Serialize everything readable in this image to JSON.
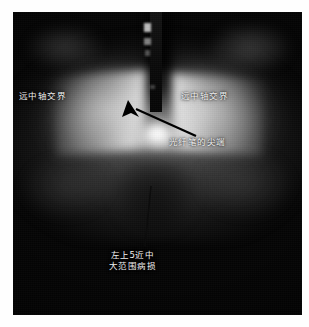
{
  "figure": {
    "type": "clinical-photograph",
    "modality": "fiber-optic transillumination (FOTI)",
    "frame_background": "#ffffff",
    "photo_background": "#050505"
  },
  "annotations": {
    "left_label": "远中轴交界",
    "right_label": "远中轴交界",
    "tip_label": "光纤笔的尖端",
    "lesion_label_line1": "左上5近中",
    "lesion_label_line2": "大范围病损"
  },
  "markers": {
    "arrow": {
      "name": "arrow-to-fiber-tip",
      "color": "#000000",
      "from_x": 196,
      "from_y": 136,
      "to_x": 131,
      "to_y": 106
    },
    "pointer_line": {
      "name": "pointer-line-to-lesion",
      "color": "#0b0b0b",
      "from_x": 145,
      "from_y": 246,
      "to_x": 151,
      "to_y": 186
    }
  },
  "colors": {
    "annotation_text": "#f2f2f2",
    "hotspot": "#ffffff",
    "probe": "#0a0a0a",
    "page": "#ffffff"
  }
}
